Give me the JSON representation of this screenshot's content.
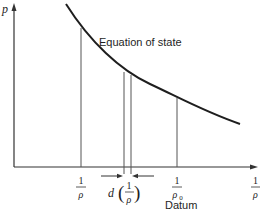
{
  "diagram": {
    "type": "p versus specific volume (1/rho) plot",
    "y_axis": {
      "label": "p"
    },
    "x_axis": {
      "label_num": "1",
      "label_den": "ρ"
    },
    "curve": {
      "label": "Equation of state"
    },
    "markers": [
      {
        "id": "state",
        "num": "1",
        "den": "ρ"
      },
      {
        "id": "increment",
        "prefix": "d",
        "num": "1",
        "den": "ρ"
      },
      {
        "id": "datum",
        "num": "1",
        "den": "ρ",
        "den_sub": "0",
        "caption": "Datum"
      }
    ],
    "colors": {
      "ink": "#1e1e1e",
      "thin": "#555555",
      "background": "#ffffff"
    }
  }
}
